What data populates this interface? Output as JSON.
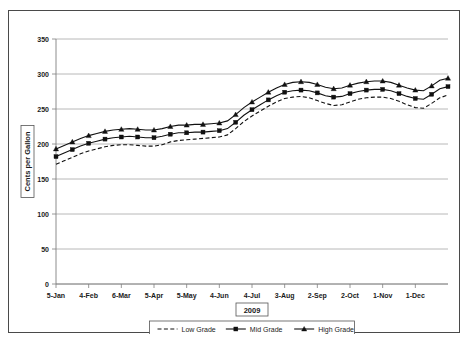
{
  "chart_data": {
    "type": "line",
    "title": "",
    "xlabel": "2009",
    "ylabel": "Cents per Gallon",
    "ylim": [
      0,
      350
    ],
    "yticks": [
      0,
      50,
      100,
      150,
      200,
      250,
      300,
      350
    ],
    "grid": true,
    "legend_position": "bottom",
    "xtick_labels": [
      "5-Jan",
      "4-Feb",
      "6-Mar",
      "5-Apr",
      "5-May",
      "4-Jun",
      "4-Jul",
      "3-Aug",
      "2-Sep",
      "2-Oct",
      "1-Nov",
      "1-Dec"
    ],
    "x_index_of_ticks": [
      0,
      4,
      8,
      12,
      16,
      20,
      24,
      28,
      32,
      36,
      40,
      44
    ],
    "x_count": 49,
    "series": [
      {
        "name": "Low Grade",
        "style": "dashed",
        "marker": "none",
        "color": "#111111",
        "values": [
          171,
          176,
          181,
          186,
          190,
          193,
          196,
          198,
          199,
          199,
          198,
          197,
          197,
          199,
          203,
          205,
          206,
          207,
          208,
          209,
          210,
          213,
          222,
          232,
          240,
          247,
          254,
          260,
          265,
          267,
          268,
          266,
          262,
          258,
          255,
          256,
          260,
          264,
          266,
          267,
          267,
          265,
          261,
          256,
          252,
          251,
          258,
          266,
          270
        ]
      },
      {
        "name": "Mid Grade",
        "style": "solid",
        "marker": "square",
        "color": "#111111",
        "values": [
          182,
          187,
          192,
          197,
          201,
          204,
          207,
          209,
          210,
          211,
          210,
          209,
          209,
          211,
          214,
          216,
          216,
          217,
          217,
          218,
          219,
          222,
          231,
          241,
          249,
          256,
          263,
          269,
          274,
          276,
          277,
          276,
          273,
          269,
          267,
          268,
          272,
          275,
          277,
          278,
          278,
          276,
          272,
          268,
          265,
          264,
          271,
          279,
          282
        ]
      },
      {
        "name": "High Grade",
        "style": "solid",
        "marker": "triangle",
        "color": "#111111",
        "values": [
          193,
          198,
          203,
          208,
          212,
          215,
          218,
          220,
          221,
          222,
          221,
          220,
          220,
          222,
          225,
          227,
          227,
          228,
          228,
          229,
          230,
          233,
          242,
          252,
          260,
          267,
          274,
          280,
          285,
          288,
          289,
          288,
          285,
          281,
          279,
          280,
          284,
          287,
          289,
          290,
          290,
          288,
          284,
          280,
          277,
          276,
          283,
          291,
          294
        ]
      }
    ]
  },
  "legend": {
    "items": [
      {
        "label": "Low Grade"
      },
      {
        "label": "Mid Grade"
      },
      {
        "label": "High Grade"
      }
    ]
  },
  "axes": {
    "x_axis_title": "2009",
    "y_axis_title": "Cents per Gallon"
  }
}
